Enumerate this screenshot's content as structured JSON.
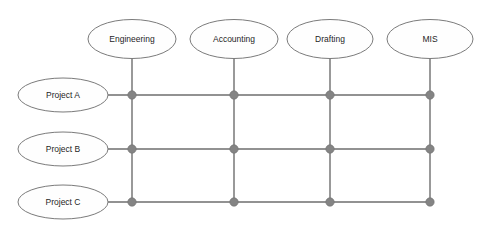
{
  "diagram": {
    "type": "matrix-organization-chart",
    "background_color": "#ffffff",
    "line_color": "#6e6e6e",
    "node_fill_color": "#fefefe",
    "node_stroke_color": "#7b7b7b",
    "dot_color": "#848484",
    "text_color": "#1f1f1f",
    "departments": [
      {
        "id": "engineering",
        "label": "Engineering",
        "cx": 132,
        "cy": 39,
        "rx": 44,
        "ry": 19.5
      },
      {
        "id": "accounting",
        "label": "Accounting",
        "cx": 234,
        "cy": 39,
        "rx": 44,
        "ry": 19.5
      },
      {
        "id": "drafting",
        "label": "Drafting",
        "cx": 330,
        "cy": 39,
        "rx": 43,
        "ry": 19.5
      },
      {
        "id": "mis",
        "label": "MIS",
        "cx": 430,
        "cy": 39,
        "rx": 43,
        "ry": 19.5
      }
    ],
    "projects": [
      {
        "id": "project-a",
        "label": "Project A",
        "cx": 63,
        "cy": 95,
        "rx": 45,
        "ry": 17
      },
      {
        "id": "project-b",
        "label": "Project B",
        "cx": 63,
        "cy": 149,
        "rx": 45,
        "ry": 17
      },
      {
        "id": "project-c",
        "label": "Project C",
        "cx": 63,
        "cy": 202,
        "rx": 45,
        "ry": 17
      }
    ],
    "column_x": [
      132,
      234,
      330,
      430
    ],
    "row_y": [
      95,
      149,
      202
    ],
    "vertical_line_top": 58,
    "vertical_line_bottom": 202,
    "horizontal_line_left": 108,
    "horizontal_line_right": 430,
    "dot_radius": 4.2,
    "intersections": [
      {
        "project": "Project A",
        "department": "Engineering",
        "x": 132,
        "y": 95
      },
      {
        "project": "Project A",
        "department": "Accounting",
        "x": 234,
        "y": 95
      },
      {
        "project": "Project A",
        "department": "Drafting",
        "x": 330,
        "y": 95
      },
      {
        "project": "Project A",
        "department": "MIS",
        "x": 430,
        "y": 95
      },
      {
        "project": "Project B",
        "department": "Engineering",
        "x": 132,
        "y": 149
      },
      {
        "project": "Project B",
        "department": "Accounting",
        "x": 234,
        "y": 149
      },
      {
        "project": "Project B",
        "department": "Drafting",
        "x": 330,
        "y": 149
      },
      {
        "project": "Project B",
        "department": "MIS",
        "x": 430,
        "y": 149
      },
      {
        "project": "Project C",
        "department": "Engineering",
        "x": 132,
        "y": 202
      },
      {
        "project": "Project C",
        "department": "Accounting",
        "x": 234,
        "y": 202
      },
      {
        "project": "Project C",
        "department": "Drafting",
        "x": 330,
        "y": 202
      },
      {
        "project": "Project C",
        "department": "MIS",
        "x": 430,
        "y": 202
      }
    ]
  }
}
